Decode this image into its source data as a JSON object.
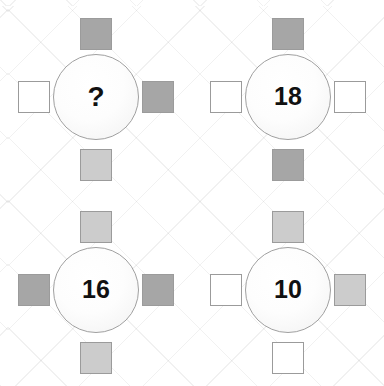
{
  "puzzle": {
    "type": "visual-logic-puzzle",
    "layout": "2x2 grid of wheel units; each unit is a circle with a number surrounded by four squares (top, right, bottom, left)",
    "background": "faint diagonal diamond lattice",
    "palette": {
      "dark_square_fill": "#a6a6a6",
      "light_square_fill": "#cccccc",
      "empty_square_fill": "#ffffff",
      "square_border": "#9b9b9b",
      "circle_border": "#a0a0a0",
      "circle_fill": "#fdfdfd",
      "number_color": "#111111",
      "lattice_line": "#f0f0f0",
      "page_background": "#ffffff"
    },
    "shade_legend": [
      {
        "key": "dark",
        "label": "dark gray",
        "fill": "#a6a6a6"
      },
      {
        "key": "light",
        "label": "light gray",
        "fill": "#cccccc"
      },
      {
        "key": "empty",
        "label": "white / empty",
        "fill": "#ffffff"
      }
    ],
    "cells": [
      {
        "id": "cell-1",
        "position": "top-left",
        "value": "?",
        "is_unknown": true,
        "squares": {
          "top": "dark",
          "right": "dark",
          "bottom": "light",
          "left": "empty"
        }
      },
      {
        "id": "cell-2",
        "position": "top-right",
        "value": "18",
        "is_unknown": false,
        "squares": {
          "top": "dark",
          "right": "empty",
          "bottom": "dark",
          "left": "empty"
        }
      },
      {
        "id": "cell-3",
        "position": "bottom-left",
        "value": "16",
        "is_unknown": false,
        "squares": {
          "top": "light",
          "right": "dark",
          "bottom": "light",
          "left": "dark"
        }
      },
      {
        "id": "cell-4",
        "position": "bottom-right",
        "value": "10",
        "is_unknown": false,
        "squares": {
          "top": "light",
          "right": "light",
          "bottom": "empty",
          "left": "empty"
        }
      }
    ]
  }
}
